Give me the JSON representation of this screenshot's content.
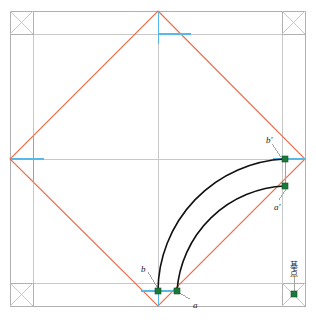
{
  "figure": {
    "canvas": {
      "width": 316,
      "height": 320,
      "background": "#ffffff"
    }
  },
  "colors": {
    "frame_gray": "#b0b0b0",
    "grid_gray": "#c8c8c8",
    "diamond_red": "#e8603c",
    "axis_blue": "#56b9e8",
    "arc_black": "#111111",
    "point_green": "#1b7a3a",
    "label_black": "#1a1a1a",
    "leader_gray": "#9a9a9a"
  },
  "frame": {
    "outer_rect": {
      "x": 10,
      "y": 11,
      "width": 295,
      "height": 295
    },
    "inset_offset": 23,
    "corner_box_size": 23,
    "corner_boxes": [
      {
        "name": "top-left",
        "x": 10,
        "y": 11,
        "size": 23
      },
      {
        "name": "top-right",
        "x": 282,
        "y": 11,
        "size": 23
      },
      {
        "name": "bottom-left",
        "x": 10,
        "y": 283,
        "size": 23
      },
      {
        "name": "bottom-right",
        "x": 282,
        "y": 283,
        "size": 23
      }
    ]
  },
  "diamond": {
    "stroke": "#e8603c",
    "vertices": [
      {
        "name": "top",
        "x": 158,
        "y": 11
      },
      {
        "name": "right",
        "x": 305,
        "y": 159
      },
      {
        "name": "bottom",
        "x": 158,
        "y": 306
      },
      {
        "name": "left",
        "x": 10,
        "y": 159
      }
    ]
  },
  "center": {
    "x": 158,
    "y": 159
  },
  "blue_marks": [
    {
      "name": "top-vertical",
      "x1": 158,
      "y1": 11,
      "x2": 158,
      "y2": 44
    },
    {
      "name": "top-horizontal",
      "x1": 158,
      "y1": 34,
      "x2": 190,
      "y2": 34
    },
    {
      "name": "left-horizontal",
      "x1": 10,
      "y1": 159,
      "x2": 43,
      "y2": 159
    },
    {
      "name": "left-vertical",
      "x1": 33,
      "y1": 135,
      "x2": 33,
      "y2": 183
    },
    {
      "name": "right-horizontal",
      "x1": 272,
      "y1": 159,
      "x2": 305,
      "y2": 159
    },
    {
      "name": "right-vertical",
      "x1": 285,
      "y1": 159,
      "x2": 285,
      "y2": 186
    },
    {
      "name": "bottom-horizontal",
      "x1": 140,
      "y1": 291,
      "x2": 178,
      "y2": 291
    },
    {
      "name": "bottom-vertical",
      "x1": 158,
      "y1": 291,
      "x2": 158,
      "y2": 306
    }
  ],
  "arcs": [
    {
      "name": "outer-arc-b-to-bprime",
      "start": {
        "x": 158,
        "y": 291
      },
      "end": {
        "x": 285,
        "y": 159
      },
      "radius": 133,
      "stroke": "#111111"
    },
    {
      "name": "inner-arc-a-to-aprime",
      "start": {
        "x": 177,
        "y": 291
      },
      "end": {
        "x": 285,
        "y": 186
      },
      "radius": 113,
      "stroke": "#111111"
    }
  ],
  "points": [
    {
      "id": "b",
      "label": "b",
      "x": 158,
      "y": 291,
      "color": "#1b7a3a"
    },
    {
      "id": "a",
      "label": "a",
      "x": 177,
      "y": 291,
      "color": "#1b7a3a"
    },
    {
      "id": "bprime",
      "label": "b'",
      "x": 285,
      "y": 159,
      "color": "#1b7a3a"
    },
    {
      "id": "aprime",
      "label": "a'",
      "x": 285,
      "y": 186,
      "color": "#1b7a3a"
    },
    {
      "id": "kiten",
      "label": "",
      "x": 294,
      "y": 294,
      "color": "#1b7a3a"
    }
  ],
  "labels": [
    {
      "id": "label-b",
      "text": "b",
      "x": 141,
      "y": 265,
      "kind": "math"
    },
    {
      "id": "label-a",
      "text": "a",
      "x": 193,
      "y": 301,
      "kind": "math"
    },
    {
      "id": "label-bprime",
      "text": "b'",
      "x": 266,
      "y": 136,
      "kind": "math"
    },
    {
      "id": "label-aprime",
      "text": "a'",
      "x": 274,
      "y": 203,
      "kind": "math"
    },
    {
      "id": "label-kiten",
      "text": "基点",
      "x": 288,
      "y": 262,
      "kind": "jp"
    }
  ],
  "leaders": [
    {
      "name": "leader-b",
      "x1": 148,
      "y1": 272,
      "x2": 157,
      "y2": 287
    },
    {
      "name": "leader-a",
      "x1": 190,
      "y1": 299,
      "x2": 179,
      "y2": 293
    },
    {
      "name": "leader-bprime",
      "x1": 272,
      "y1": 144,
      "x2": 281,
      "y2": 157
    },
    {
      "name": "leader-aprime",
      "x1": 279,
      "y1": 200,
      "x2": 286,
      "y2": 189
    },
    {
      "name": "leader-kiten",
      "x1": 294,
      "y1": 276,
      "x2": 294,
      "y2": 291
    }
  ]
}
